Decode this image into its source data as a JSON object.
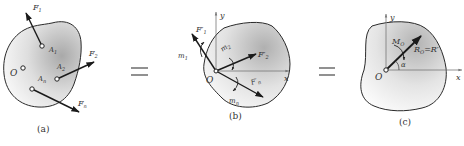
{
  "panels": [
    {
      "id": "a",
      "caption": "(a)",
      "labels": {
        "O": "O",
        "A1": "A",
        "A1_sub": "1",
        "A2": "A",
        "A2_sub": "2",
        "An": "A",
        "An_sub": "n",
        "F1": "F",
        "F1_sub": "1",
        "F2": "F",
        "F2_sub": "2",
        "Fn": "F",
        "Fn_sub": "n"
      }
    },
    {
      "id": "b",
      "caption": "(b)",
      "labels": {
        "O": "O",
        "x": "x",
        "y": "y",
        "F1p": "F′",
        "F1p_sub": "1",
        "F2p": "F′",
        "F2p_sub": "2",
        "Fnp": "F′",
        "Fnp_sub": "n",
        "m1": "m",
        "m1_sub": "1",
        "m2": "m",
        "m2_sub": "2",
        "mn": "m",
        "mn_sub": "n"
      }
    },
    {
      "id": "c",
      "caption": "(c)",
      "labels": {
        "O": "O",
        "x": "x",
        "y": "y",
        "MO": "M",
        "MO_sub": "O",
        "RO": "R",
        "RO_sub": "O",
        "RO_eq": "=R′",
        "alpha": "α"
      }
    }
  ],
  "equals": [
    "=",
    "="
  ],
  "colors": {
    "outline": "#2a2a2a",
    "fill_dark": "#b8b8b8",
    "fill_light": "#f4f4f4",
    "arrow": "#1a1a1a",
    "axis": "#777777"
  }
}
